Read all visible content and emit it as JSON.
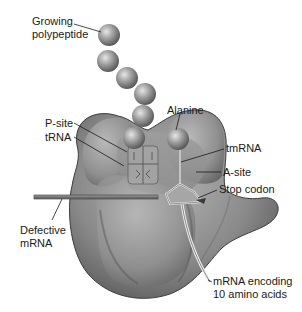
{
  "diagram": {
    "labels": {
      "growing_polypeptide_line1": "Growing",
      "growing_polypeptide_line2": "polypeptide",
      "p_site": "P-site",
      "trna": "tRNA",
      "alanine": "Alanine",
      "tmrna": "tmRNA",
      "a_site": "A-site",
      "stop_codon": "Stop codon",
      "defective_mrna_line1": "Defective",
      "defective_mrna_line2": "mRNA",
      "mrna_encoding_line1": "mRNA encoding",
      "mrna_encoding_line2": "10 amino acids"
    },
    "polypeptide_bead_count": 6,
    "colors": {
      "ribosome": "#8f8f8f",
      "ribosome_dark": "#4e4e4e",
      "bead": "#9a9a9a",
      "text": "#1a1a1a",
      "background": "#ffffff"
    }
  }
}
